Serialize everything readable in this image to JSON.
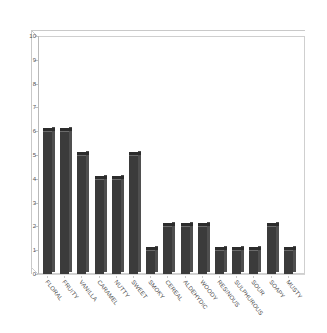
{
  "chart_data": {
    "type": "bar",
    "title": "",
    "subtitle": "",
    "xlabel": "",
    "ylabel": "",
    "ylim": [
      0,
      10
    ],
    "yticks": [
      0,
      1,
      2,
      3,
      4,
      5,
      6,
      7,
      8,
      9,
      10
    ],
    "ytick_labels": [
      "0",
      "1",
      "2",
      "3",
      "4",
      "5",
      "6",
      "7",
      "8",
      "9",
      "10"
    ],
    "grid": false,
    "legend": false,
    "legend_position": "none",
    "style": "3d-bar",
    "bar_color": "#3b3b3b",
    "bar_side_color": "#4f4f4f",
    "bar_top_color": "#2c2c2c",
    "axis_color": "#c2c2c2",
    "background_color": "#ffffff",
    "categories": [
      "FLORAL",
      "FRUITY",
      "VANILLA",
      "CARAMEL",
      "NUTTY",
      "SWEET",
      "SMOKY",
      "CEREAL",
      "ALDEHYDIC",
      "WOODY",
      "RESINOUS",
      "SULPHUROUS",
      "SOUR",
      "SOAPY",
      "MUSTY"
    ],
    "values": [
      6,
      6,
      5,
      4,
      4,
      5,
      1,
      2,
      2,
      2,
      1,
      1,
      1,
      2,
      1
    ]
  }
}
